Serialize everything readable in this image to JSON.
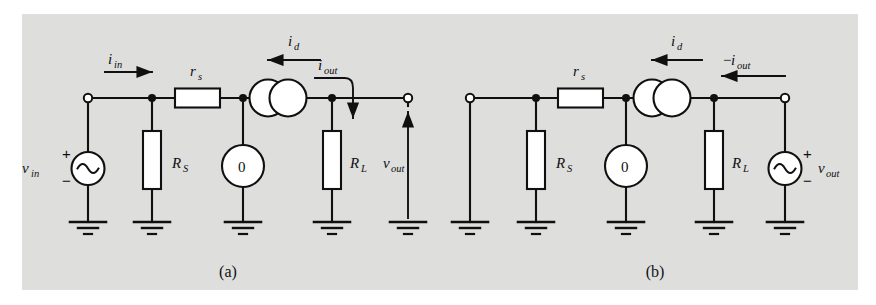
{
  "figure": {
    "background_color": "#dededd",
    "page_color": "#ffffff",
    "ink_color": "#101010",
    "component_fill": "#ffffff"
  },
  "captions": {
    "a": "(a)",
    "b": "(b)"
  },
  "circuit_a": {
    "name": "Thevenin/Norton two-port small-signal model, forward drive",
    "labels": {
      "v_in_base": "v",
      "v_in_sub": "in",
      "i_in_base": "i",
      "i_in_sub": "in",
      "r_s_base": "r",
      "r_s_sub": "s",
      "R_S_base": "R",
      "R_S_sub": "S",
      "zero_source": "0",
      "i_d_base": "i",
      "i_d_sub": "d",
      "i_out_base": "i",
      "i_out_sub": "out",
      "R_L_base": "R",
      "R_L_sub": "L",
      "v_out_base": "v",
      "v_out_sub": "out",
      "plus": "+",
      "minus": "−"
    },
    "components": [
      {
        "type": "terminal-open",
        "name": "input-terminal"
      },
      {
        "type": "ac-source",
        "name": "vin-source",
        "polarity_side": "left",
        "plus": "+",
        "minus": "−"
      },
      {
        "type": "resistor-vertical",
        "name": "RS-resistor",
        "label": "R_S"
      },
      {
        "type": "resistor-horizontal",
        "name": "rs-resistor",
        "label": "r_s"
      },
      {
        "type": "circle-source",
        "name": "zero-source",
        "value": "0"
      },
      {
        "type": "current-source-double-circle",
        "name": "id-current-source",
        "label": "i_d"
      },
      {
        "type": "resistor-vertical",
        "name": "RL-resistor",
        "label": "R_L"
      },
      {
        "type": "terminal-open",
        "name": "output-terminal"
      },
      {
        "type": "ground",
        "name": "ground-symbol",
        "count": 5
      }
    ],
    "arrows": [
      {
        "name": "i-in-arrow",
        "direction": "right",
        "label": "i_in"
      },
      {
        "name": "i-d-arrow",
        "direction": "left",
        "label": "i_d"
      },
      {
        "name": "i-out-arrow",
        "direction": "down-curved",
        "label": "i_out"
      },
      {
        "name": "v-out-arrow",
        "direction": "up",
        "label": "v_out"
      }
    ]
  },
  "circuit_b": {
    "name": "Thevenin/Norton two-port small-signal model, reverse drive",
    "labels": {
      "r_s_base": "r",
      "r_s_sub": "s",
      "R_S_base": "R",
      "R_S_sub": "S",
      "zero_source": "0",
      "i_d_base": "i",
      "i_d_sub": "d",
      "neg_i_out_prefix": "−",
      "i_out_base": "i",
      "i_out_sub": "out",
      "R_L_base": "R",
      "R_L_sub": "L",
      "v_out_base": "v",
      "v_out_sub": "out",
      "plus": "+",
      "minus": "−"
    },
    "components": [
      {
        "type": "terminal-open",
        "name": "input-terminal"
      },
      {
        "type": "resistor-vertical",
        "name": "RS-resistor",
        "label": "R_S"
      },
      {
        "type": "resistor-horizontal",
        "name": "rs-resistor",
        "label": "r_s"
      },
      {
        "type": "circle-source",
        "name": "zero-source",
        "value": "0"
      },
      {
        "type": "current-source-double-circle",
        "name": "id-current-source",
        "label": "i_d"
      },
      {
        "type": "resistor-vertical",
        "name": "RL-resistor",
        "label": "R_L"
      },
      {
        "type": "ac-source",
        "name": "vout-source",
        "polarity_side": "right",
        "plus": "+",
        "minus": "−"
      },
      {
        "type": "terminal-open",
        "name": "output-terminal"
      },
      {
        "type": "ground",
        "name": "ground-symbol",
        "count": 5
      }
    ],
    "arrows": [
      {
        "name": "i-d-arrow",
        "direction": "left",
        "label": "i_d"
      },
      {
        "name": "neg-i-out-arrow",
        "direction": "left",
        "label": "-i_out"
      }
    ]
  }
}
